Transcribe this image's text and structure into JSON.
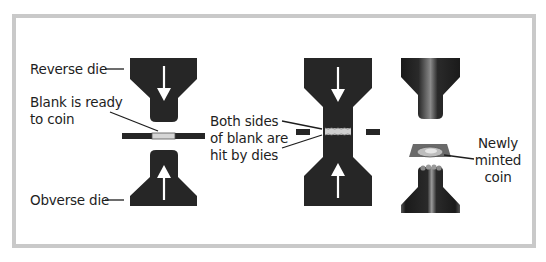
{
  "diagram": {
    "colors": {
      "frame": "#c9c9c9",
      "die": "#262626",
      "arrow": "#ffffff",
      "blank": "#bdbdbd",
      "leader": "#1e1e1e"
    },
    "stages": [
      {
        "id": "before-strike",
        "labels": {
          "reverse_die": "Reverse die",
          "blank_line1": "Blank is ready",
          "blank_line2": "to coin",
          "obverse_die": "Obverse die"
        }
      },
      {
        "id": "strike",
        "labels": {
          "line1": "Both sides",
          "line2": "of blank are",
          "line3": "hit by dies"
        }
      },
      {
        "id": "after-strike",
        "labels": {
          "line1": "Newly",
          "line2": "minted",
          "line3": "coin"
        }
      }
    ]
  }
}
